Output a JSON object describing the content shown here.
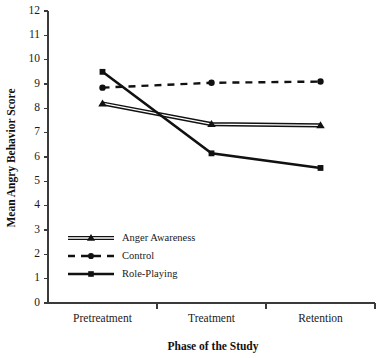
{
  "chart_data": {
    "type": "line",
    "title": "",
    "xlabel": "Phase of the Study",
    "ylabel": "Mean Angry Behavior Score",
    "categories": [
      "Pretreatment",
      "Treatment",
      "Retention"
    ],
    "ylim": [
      0,
      12
    ],
    "yticks": [
      0,
      1,
      2,
      3,
      4,
      5,
      6,
      7,
      8,
      9,
      10,
      11,
      12
    ],
    "ytick_labels": [
      "0",
      "1",
      "2",
      "3",
      "4",
      "5",
      "6",
      "7",
      "8",
      "9",
      "10",
      "11",
      "12"
    ],
    "grid": false,
    "legend_position": "lower-left-inside",
    "series": [
      {
        "name": "Anger Awareness",
        "values": [
          8.2,
          7.35,
          7.3
        ],
        "marker": "triangle",
        "line_style": "double-solid",
        "color": "#111111"
      },
      {
        "name": "Control",
        "values": [
          8.85,
          9.05,
          9.1
        ],
        "marker": "circle",
        "line_style": "dashed",
        "color": "#111111"
      },
      {
        "name": "Role-Playing",
        "values": [
          9.5,
          6.15,
          5.55
        ],
        "marker": "square",
        "line_style": "solid",
        "color": "#111111"
      }
    ]
  },
  "axes": {
    "y_title": "Mean Angry Behavior Score",
    "x_title": "Phase of the Study",
    "y_max_label": "12",
    "y_min_label": "0"
  },
  "legend": {
    "entries": [
      {
        "label": "Anger Awareness",
        "marker": "triangle-marker",
        "style": "double-solid"
      },
      {
        "label": "Control",
        "marker": "circle-marker",
        "style": "dashed"
      },
      {
        "label": "Role-Playing",
        "marker": "square-marker",
        "style": "solid"
      }
    ]
  },
  "colors": {
    "ink": "#111111",
    "axis": "#3a3a3a",
    "background": "#ffffff"
  }
}
